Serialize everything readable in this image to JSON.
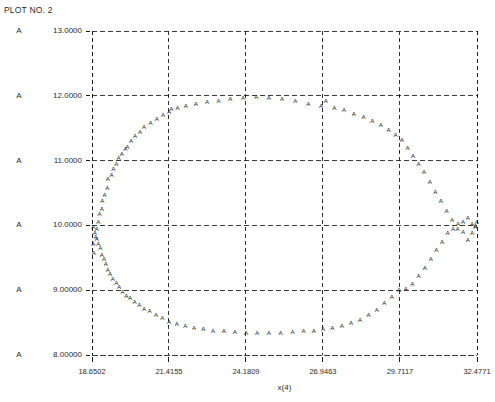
{
  "title": "PLOT NO. 2",
  "series_symbol": "A",
  "axes": {
    "xlabel": "x(4)",
    "ylabel": "",
    "xticks": [
      "18.6502",
      "21.4155",
      "24.1809",
      "26.9463",
      "29.7117",
      "32.4771"
    ],
    "yticks": [
      "13.0000",
      "12.0000",
      "11.0000",
      "10.0000",
      "9.00000",
      "8.00000"
    ],
    "xlim": [
      18.6502,
      32.4771
    ],
    "ylim": [
      8.0,
      13.0
    ],
    "grid": "dashed",
    "tick_marks": true
  },
  "colors": {
    "background": "#ffffff",
    "text": "#2a2a2a",
    "grid": "#1a1a1a",
    "marker": "#1a1a1a",
    "axis": "#1a1a1a"
  },
  "chart_data": {
    "type": "scatter",
    "title": "PLOT NO. 2",
    "xlabel": "x(4)",
    "ylabel": "",
    "xlim": [
      18.6502,
      32.4771
    ],
    "ylim": [
      8.0,
      13.0
    ],
    "grid": true,
    "legend_position": "none",
    "marker": "A",
    "series": [
      {
        "name": "A",
        "x": [
          18.72,
          18.7,
          18.78,
          18.82,
          18.88,
          18.92,
          19.0,
          19.02,
          19.1,
          19.2,
          19.22,
          19.35,
          19.42,
          19.52,
          19.6,
          19.72,
          19.85,
          19.92,
          20.05,
          20.2,
          20.38,
          20.52,
          20.75,
          20.98,
          21.2,
          21.42,
          21.5,
          21.72,
          22.02,
          22.38,
          22.78,
          23.2,
          23.62,
          24.08,
          24.55,
          25.0,
          25.48,
          25.95,
          26.42,
          26.88,
          27.05,
          27.35,
          27.7,
          28.05,
          28.4,
          28.72,
          29.02,
          29.3,
          29.55,
          29.78,
          29.98,
          30.18,
          30.38,
          30.58,
          30.78,
          30.98,
          31.18,
          31.38,
          31.58,
          31.78,
          31.98,
          32.15,
          32.3,
          32.42
        ],
        "y": [
          9.58,
          9.72,
          9.82,
          9.95,
          10.05,
          10.18,
          10.25,
          10.38,
          10.48,
          10.58,
          10.72,
          10.78,
          10.88,
          10.95,
          11.05,
          11.1,
          11.18,
          11.22,
          11.3,
          11.38,
          11.45,
          11.52,
          11.58,
          11.65,
          11.7,
          11.75,
          11.8,
          11.82,
          11.85,
          11.88,
          11.9,
          11.92,
          11.95,
          11.97,
          11.98,
          11.97,
          11.95,
          11.92,
          11.88,
          11.85,
          11.92,
          11.82,
          11.78,
          11.72,
          11.68,
          11.62,
          11.55,
          11.48,
          11.4,
          11.32,
          11.2,
          11.08,
          10.95,
          10.82,
          10.68,
          10.52,
          10.38,
          10.22,
          10.08,
          9.95,
          10.05,
          10.12,
          10.02,
          9.98
        ]
      },
      {
        "name": "A-lower",
        "x": [
          18.7,
          18.75,
          18.82,
          18.88,
          18.95,
          19.0,
          19.08,
          19.15,
          19.22,
          19.3,
          19.4,
          19.52,
          19.62,
          19.75,
          19.88,
          20.02,
          20.18,
          20.35,
          20.52,
          20.72,
          20.95,
          21.18,
          21.42,
          21.7,
          22.0,
          22.32,
          22.65,
          23.0,
          23.38,
          23.78,
          24.18,
          24.58,
          25.0,
          25.42,
          25.85,
          26.25,
          26.62,
          26.95,
          27.28,
          27.62,
          27.95,
          28.28,
          28.58,
          28.88,
          29.15,
          29.42,
          29.68,
          29.92,
          30.15,
          30.38,
          30.6,
          30.82,
          31.02,
          31.22,
          31.42,
          31.62,
          31.8,
          31.98,
          32.15,
          32.3,
          32.42,
          32.47
        ],
        "y": [
          9.98,
          9.88,
          9.8,
          9.72,
          9.65,
          9.55,
          9.48,
          9.4,
          9.32,
          9.25,
          9.18,
          9.12,
          9.05,
          8.98,
          8.92,
          8.88,
          8.82,
          8.78,
          8.72,
          8.68,
          8.62,
          8.58,
          8.52,
          8.48,
          8.45,
          8.42,
          8.4,
          8.38,
          8.38,
          8.36,
          8.35,
          8.35,
          8.34,
          8.35,
          8.36,
          8.37,
          8.38,
          8.4,
          8.42,
          8.45,
          8.5,
          8.55,
          8.62,
          8.7,
          8.8,
          8.9,
          9.0,
          9.02,
          9.1,
          9.22,
          9.35,
          9.48,
          9.62,
          9.75,
          9.88,
          9.95,
          10.02,
          9.9,
          9.78,
          9.88,
          10.0,
          10.05
        ]
      }
    ]
  }
}
